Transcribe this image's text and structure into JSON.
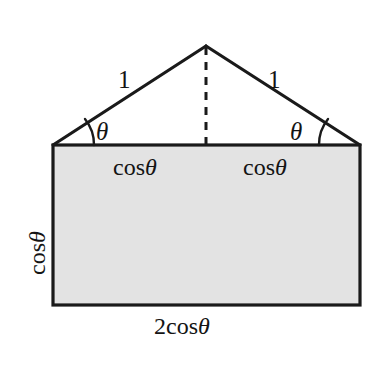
{
  "figure": {
    "kind": "geometry-diagram",
    "colors": {
      "background": "#ffffff",
      "stroke": "#1a1a1a",
      "rectangle_fill": "#e3e3e3",
      "text": "#141414"
    },
    "labels": {
      "side_left": {
        "text": "1",
        "parts": {
          "number": "1"
        }
      },
      "side_right": {
        "text": "1",
        "parts": {
          "number": "1"
        }
      },
      "angle_left": {
        "text": "θ",
        "parts": {
          "variable": "θ"
        }
      },
      "angle_right": {
        "text": "θ",
        "parts": {
          "variable": "θ"
        }
      },
      "base_left": {
        "text": "cosθ",
        "parts": {
          "function": "cos",
          "variable": "θ"
        }
      },
      "base_right": {
        "text": "cosθ",
        "parts": {
          "function": "cos",
          "variable": "θ"
        }
      },
      "height": {
        "text": "cosθ",
        "parts": {
          "function": "cos",
          "variable": "θ"
        }
      },
      "bottom": {
        "text": "2cosθ",
        "parts": {
          "coefficient": "2",
          "function": "cos",
          "variable": "θ"
        }
      }
    },
    "geometry": {
      "apex": {
        "x": 206,
        "y": 46
      },
      "rectangle": {
        "left": 53,
        "top": 145,
        "right": 360,
        "bottom": 305
      },
      "dashed_altitude": {
        "x": 206,
        "y_top": 46,
        "y_bottom": 145
      }
    }
  }
}
